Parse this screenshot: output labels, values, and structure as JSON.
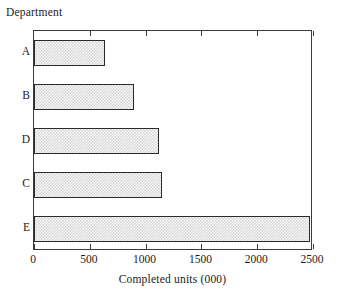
{
  "chart_data": {
    "type": "bar",
    "orientation": "horizontal",
    "title": "",
    "xlabel": "Completed units (000)",
    "ylabel": "Department",
    "categories": [
      "A",
      "B",
      "D",
      "C",
      "E"
    ],
    "values": [
      640,
      900,
      1120,
      1150,
      2470
    ],
    "xlim": [
      0,
      2500
    ],
    "xticks": [
      0,
      500,
      1000,
      1500,
      2000,
      2500
    ],
    "xtick_labels": [
      "0",
      "500",
      "1000",
      "1500",
      "2000",
      "2500"
    ],
    "grid": false,
    "legend": false,
    "series": [
      {
        "name": "Completed units",
        "values": [
          640,
          900,
          1120,
          1150,
          2470
        ]
      }
    ],
    "colors": {
      "bar_fill": "#d9d9d9",
      "bar_edge": "#2a2a2a",
      "axis": "#3a3a3a",
      "background": "#ffffff",
      "text": "#1a1a1a"
    }
  }
}
